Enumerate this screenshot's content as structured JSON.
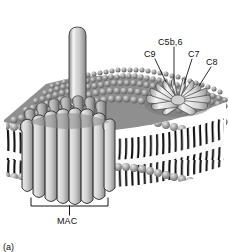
{
  "figure": {
    "name": "membrane-attack-complex-diagram",
    "caption": "(a)",
    "background_color": "#ffffff",
    "ink_color": "#1a1a1a"
  },
  "labels": {
    "c5b6": "C5b,6",
    "c9": "C9",
    "c7": "C7",
    "c8": "C8",
    "mac": "MAC"
  },
  "structures": {
    "membrane": {
      "name": "lipid-bilayer",
      "head_color": "#9a9a9a",
      "tail_color": "#111111",
      "core_color": "#efefef",
      "top_face_color": "#8f8f8f"
    },
    "mac_pore": {
      "name": "mac-pore-barrel",
      "stave_count": 11,
      "fill_light": "#e9e9e9",
      "fill_mid": "#bdbdbd",
      "fill_dark": "#8d8d8d"
    },
    "inserting_monomer": {
      "name": "c9-monomer",
      "fill_light": "#e4e4e4",
      "fill_dark": "#9f9f9f"
    },
    "rosette_complex": {
      "name": "c5b-9-assembly-rosette",
      "petal_count": 13,
      "fill_light": "#f0f0f0",
      "fill_dark": "#a6a6a6"
    }
  },
  "leaders": {
    "c5b6": "vertical",
    "c9": "diagonal-down-right",
    "c7": "diagonal-down-left",
    "c8": "diagonal-down-left"
  }
}
